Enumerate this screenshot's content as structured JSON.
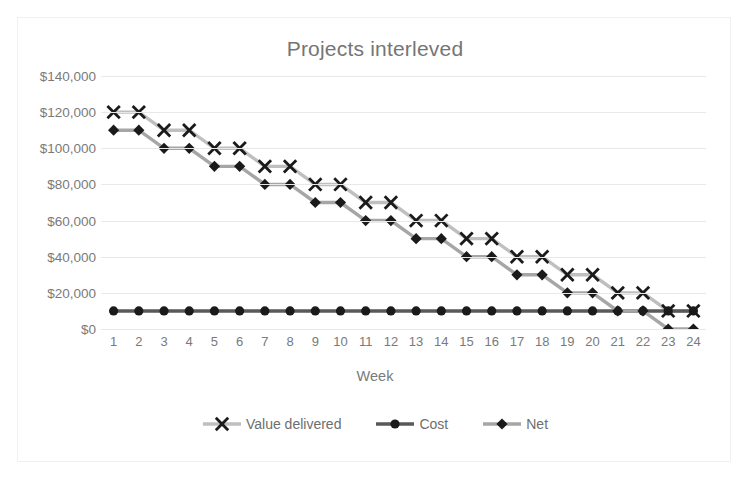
{
  "chart_data": {
    "type": "line",
    "title": "Projects interleved",
    "xlabel": "Week",
    "ylabel": "",
    "grid": true,
    "legend_position": "bottom",
    "x": [
      1,
      2,
      3,
      4,
      5,
      6,
      7,
      8,
      9,
      10,
      11,
      12,
      13,
      14,
      15,
      16,
      17,
      18,
      19,
      20,
      21,
      22,
      23,
      24
    ],
    "categories": [
      "1",
      "2",
      "3",
      "4",
      "5",
      "6",
      "7",
      "8",
      "9",
      "10",
      "11",
      "12",
      "13",
      "14",
      "15",
      "16",
      "17",
      "18",
      "19",
      "20",
      "21",
      "22",
      "23",
      "24"
    ],
    "xlabel_axis_title": "Week",
    "ylim": [
      0,
      140000
    ],
    "ytick_values": [
      0,
      20000,
      40000,
      60000,
      80000,
      100000,
      120000,
      140000
    ],
    "ytick_labels": [
      "$0",
      "$20,000",
      "$40,000",
      "$60,000",
      "$80,000",
      "$100,000",
      "$120,000",
      "$140,000"
    ],
    "series": [
      {
        "name": "Value delivered",
        "marker": "x",
        "color": "#bfbfbf",
        "marker_color": "#1a1a1a",
        "values": [
          120000,
          120000,
          110000,
          110000,
          100000,
          100000,
          90000,
          90000,
          80000,
          80000,
          70000,
          70000,
          60000,
          60000,
          50000,
          50000,
          40000,
          40000,
          30000,
          30000,
          20000,
          20000,
          10000,
          10000
        ]
      },
      {
        "name": "Cost",
        "marker": "circle",
        "color": "#595959",
        "marker_color": "#1a1a1a",
        "values": [
          10000,
          10000,
          10000,
          10000,
          10000,
          10000,
          10000,
          10000,
          10000,
          10000,
          10000,
          10000,
          10000,
          10000,
          10000,
          10000,
          10000,
          10000,
          10000,
          10000,
          10000,
          10000,
          10000,
          10000
        ]
      },
      {
        "name": "Net",
        "marker": "diamond",
        "color": "#a6a6a6",
        "marker_color": "#1a1a1a",
        "values": [
          110000,
          110000,
          100000,
          100000,
          90000,
          90000,
          80000,
          80000,
          70000,
          70000,
          60000,
          60000,
          50000,
          50000,
          40000,
          40000,
          30000,
          30000,
          20000,
          20000,
          10000,
          10000,
          0,
          0
        ]
      }
    ]
  },
  "legend": {
    "items": [
      {
        "label": "Value delivered"
      },
      {
        "label": "Cost"
      },
      {
        "label": "Net"
      }
    ]
  }
}
